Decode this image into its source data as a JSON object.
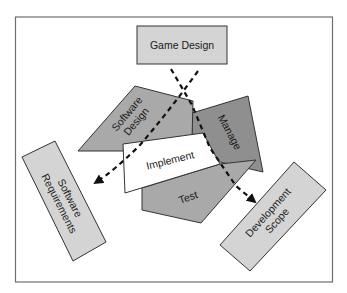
{
  "diagram": {
    "nodes": {
      "game_design": {
        "label": "Game Design"
      },
      "software_design": {
        "line1": "Software",
        "line2": "Design"
      },
      "manage": {
        "label": "Manage"
      },
      "implement": {
        "label": "Implement"
      },
      "test": {
        "label": "Test"
      },
      "software_requirements": {
        "line1": "Software",
        "line2": "Requirements"
      },
      "development_scope": {
        "line1": "Development",
        "line2": "Scope"
      }
    },
    "edges": [
      {
        "from": "Game Design",
        "to": "Software Requirements",
        "style": "dashed-arrow"
      },
      {
        "from": "Game Design",
        "to": "Development Scope",
        "style": "dashed-arrow"
      }
    ],
    "colors": {
      "frame": "#6e6e6e",
      "box_light": "#d4d4d4",
      "shape_mid": "#a9a9a9",
      "shape_dark": "#8f8f8f",
      "implement_fill": "#ffffff",
      "stroke": "#333333"
    }
  }
}
